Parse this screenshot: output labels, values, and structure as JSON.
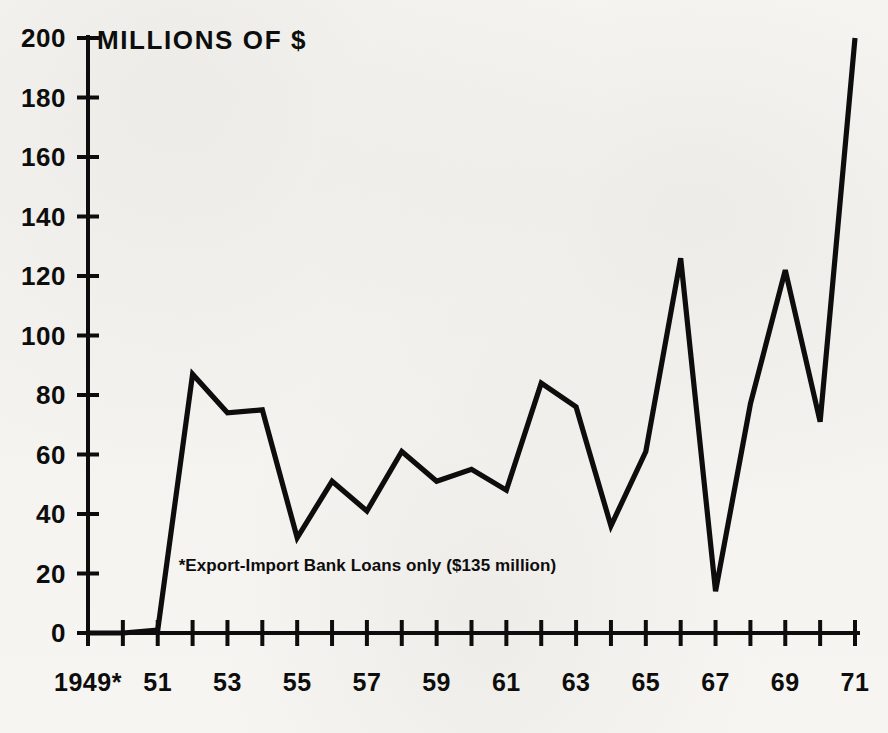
{
  "chart_data": {
    "type": "line",
    "title": "MILLIONS OF $",
    "xlabel": "",
    "ylabel": "MILLIONS OF $",
    "ylim": [
      0,
      200
    ],
    "xlim": [
      1949,
      1971
    ],
    "grid": false,
    "legend": null,
    "y_ticks": [
      0,
      20,
      40,
      60,
      80,
      100,
      120,
      140,
      160,
      180,
      200
    ],
    "y_tick_labels": [
      "0",
      "20",
      "40",
      "60",
      "80",
      "100",
      "120",
      "140",
      "160",
      "180",
      "200"
    ],
    "x_ticks": [
      1949,
      1950,
      1951,
      1952,
      1953,
      1954,
      1955,
      1956,
      1957,
      1958,
      1959,
      1960,
      1961,
      1962,
      1963,
      1964,
      1965,
      1966,
      1967,
      1968,
      1969,
      1970,
      1971
    ],
    "x_tick_labels": [
      "1949*",
      "",
      "51",
      "",
      "53",
      "",
      "55",
      "",
      "57",
      "",
      "59",
      "",
      "61",
      "",
      "63",
      "",
      "65",
      "",
      "67",
      "",
      "69",
      "",
      "71"
    ],
    "annotations": [
      {
        "text": "*Export-Import Bank Loans only ($135 million)",
        "x": 1951.6,
        "y": 21
      }
    ],
    "series": [
      {
        "name": "Loans",
        "x": [
          1949,
          1950,
          1951,
          1952,
          1953,
          1954,
          1955,
          1956,
          1957,
          1958,
          1959,
          1960,
          1961,
          1962,
          1963,
          1964,
          1965,
          1966,
          1967,
          1968,
          1969,
          1970,
          1971
        ],
        "values": [
          0,
          0,
          1,
          87,
          74,
          75,
          32,
          51,
          41,
          61,
          51,
          55,
          48,
          84,
          76,
          36,
          61,
          126,
          14,
          77,
          122,
          71,
          200
        ]
      }
    ],
    "colors": {
      "line": "#0d0d0d",
      "axis": "#0d0d0d",
      "background": "#f6f5f1",
      "text": "#0d0d0d"
    }
  }
}
